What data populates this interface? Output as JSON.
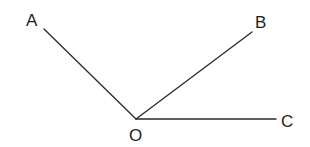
{
  "diagram": {
    "type": "angle-figure",
    "vertex": {
      "name": "O",
      "x": 136,
      "y": 119,
      "label": "O",
      "label_x": 129,
      "label_y": 141
    },
    "rays": [
      {
        "name": "OA",
        "end": {
          "x": 44,
          "y": 29
        },
        "label": "A",
        "label_x": 26,
        "label_y": 26
      },
      {
        "name": "OB",
        "end": {
          "x": 252,
          "y": 32
        },
        "label": "B",
        "label_x": 255,
        "label_y": 28
      },
      {
        "name": "OC",
        "end": {
          "x": 276,
          "y": 119
        },
        "label": "C",
        "label_x": 281,
        "label_y": 127
      }
    ],
    "line_color": "#2a2a2a",
    "label_color": "#1e1e1e"
  }
}
